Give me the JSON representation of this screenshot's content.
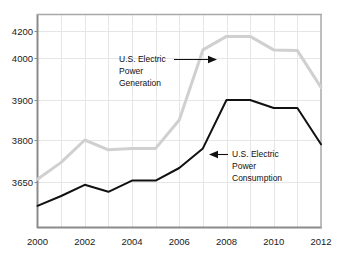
{
  "chart_data": {
    "type": "line",
    "title": "",
    "subtitle": "",
    "xlabel": "",
    "ylabel": "",
    "grid": true,
    "legend_position": "inline-annotations",
    "x": [
      2000,
      2001,
      2002,
      2003,
      2004,
      2005,
      2006,
      2007,
      2008,
      2009,
      2010,
      2011,
      2012
    ],
    "xlim": [
      2000,
      2012
    ],
    "ylim": [
      3560,
      4200
    ],
    "x_tick_labels": [
      "2000",
      "2002",
      "2004",
      "2006",
      "2008",
      "2010",
      "2012"
    ],
    "x_tick_values": [
      2000,
      2002,
      2004,
      2006,
      2008,
      2010,
      2012
    ],
    "x_minor_values": [
      2001,
      2003,
      2005,
      2007,
      2009,
      2011
    ],
    "y_tick_labels": [
      "4200",
      "4000",
      "3900",
      "3800",
      "3650"
    ],
    "y_tick_values": [
      4200,
      4000,
      3900,
      3800,
      3650
    ],
    "y_axis_note": "irregular non-linear tick spacing as drawn",
    "series": [
      {
        "name": "U.S. Electric Power Generation",
        "color": "#d0d0d0",
        "values": [
          3660,
          3720,
          3800,
          3765,
          3770,
          3770,
          3850,
          4060,
          4160,
          4160,
          4060,
          4055,
          3930
        ]
      },
      {
        "name": "U.S. Electric Power Consumption",
        "color": "#111111",
        "values": [
          3565,
          3600,
          3640,
          3615,
          3655,
          3655,
          3700,
          3770,
          3900,
          3900,
          3880,
          3880,
          3785
        ]
      }
    ],
    "annotations": [
      {
        "id": "generation-annotation",
        "lines": [
          "U.S. Electric",
          "Power",
          "Generation"
        ],
        "arrow_direction": "right",
        "target_series": "U.S. Electric Power Generation"
      },
      {
        "id": "consumption-annotation",
        "lines": [
          "U.S. Electric",
          "Power",
          "Consumption"
        ],
        "arrow_direction": "left",
        "target_series": "U.S. Electric Power Consumption"
      }
    ],
    "colors": {
      "generation_line": "#d0d0d0",
      "consumption_line": "#111111",
      "axis": "#8a8a8a",
      "grid": "#e6e6e6",
      "background": "#ffffff",
      "text": "#1a1a1a"
    }
  }
}
